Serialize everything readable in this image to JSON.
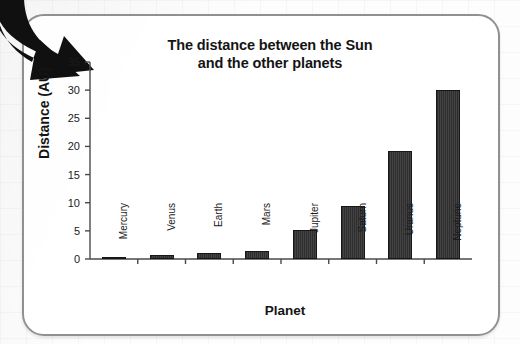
{
  "card": {
    "border_color": "#8e9092",
    "background": "#ffffff"
  },
  "annotation": {
    "arrow_name": "pointer-arrow",
    "arrow_color": "#101010",
    "direction": "down-right"
  },
  "chart_data": {
    "type": "bar",
    "title": "The distance between the Sun and the other planets",
    "title_line1": "The distance between the Sun",
    "title_line2": "and the other planets",
    "xlabel": "Planet",
    "ylabel": "Distance (AU)",
    "categories": [
      "Mercury",
      "Venus",
      "Earth",
      "Mars",
      "Jupiter",
      "Saturn",
      "Uranus",
      "Neptune"
    ],
    "values": [
      0.4,
      0.7,
      1.0,
      1.5,
      5.2,
      9.5,
      19.2,
      30.1
    ],
    "ylim": [
      0,
      35
    ],
    "yticks": [
      0,
      5,
      10,
      15,
      20,
      25,
      30,
      35
    ],
    "ytick_labels": [
      "0",
      "5",
      "10",
      "15",
      "20",
      "25",
      "30",
      "35"
    ],
    "grid": false,
    "legend": null,
    "bar_color": "#353535",
    "axis_color": "#4a4a4a"
  }
}
